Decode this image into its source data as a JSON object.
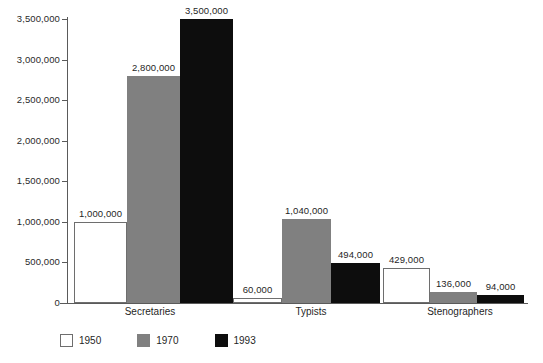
{
  "chart_data": {
    "type": "bar",
    "title": "",
    "subtitle": "",
    "xlabel": "",
    "ylabel": "",
    "categories": [
      "Secretaries",
      "Typists",
      "Stenographers"
    ],
    "series": [
      {
        "name": "1950",
        "color": "#ffffff",
        "values": [
          1000000,
          60000,
          429000
        ],
        "value_labels": [
          "1,000,000",
          "60,000",
          "429,000"
        ]
      },
      {
        "name": "1970",
        "color": "#808080",
        "values": [
          2800000,
          1040000,
          136000
        ],
        "value_labels": [
          "2,800,000",
          "1,040,000",
          "136,000"
        ]
      },
      {
        "name": "1993",
        "color": "#0d0d0d",
        "values": [
          3500000,
          494000,
          94000
        ],
        "value_labels": [
          "3,500,000",
          "494,000",
          "94,000"
        ]
      }
    ],
    "ylim": [
      0,
      3500000
    ],
    "yticks": [
      0,
      500000,
      1000000,
      1500000,
      2000000,
      2500000,
      3000000,
      3500000
    ],
    "ytick_labels": [
      "0",
      "500,000",
      "1,000,000",
      "1,500,000",
      "2,000,000",
      "2,500,000",
      "3,000,000",
      "3,500,000"
    ],
    "grid": false,
    "legend_position": "bottom-left",
    "legend_entries": [
      "1950",
      "1970",
      "1993"
    ]
  },
  "axis": {
    "tick_0": "0",
    "tick_1": "500,000",
    "tick_2": "1,000,000",
    "tick_3": "1,500,000",
    "tick_4": "2,000,000",
    "tick_5": "2,500,000",
    "tick_6": "3,000,000",
    "tick_7": "3,500,000"
  },
  "categories": {
    "c0": "Secretaries",
    "c1": "Typists",
    "c2": "Stenographers"
  },
  "legend": {
    "items": [
      {
        "label": "1950"
      },
      {
        "label": "1970"
      },
      {
        "label": "1993"
      }
    ]
  },
  "values": {
    "secretaries_1950": "1,000,000",
    "secretaries_1970": "2,800,000",
    "secretaries_1993": "3,500,000",
    "typists_1950": "60,000",
    "typists_1970": "1,040,000",
    "typists_1993": "494,000",
    "stenographers_1950": "429,000",
    "stenographers_1970": "136,000",
    "stenographers_1993": "94,000"
  }
}
